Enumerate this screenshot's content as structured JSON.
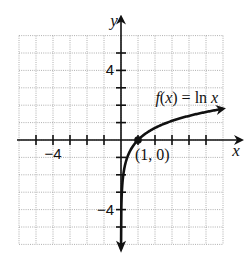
{
  "chart_data": {
    "type": "line",
    "title": "",
    "xlabel": "x",
    "ylabel": "y",
    "xlim": [
      -6,
      6
    ],
    "ylim": [
      -6,
      6
    ],
    "grid": true,
    "x_tick_step": 1,
    "y_tick_step": 1,
    "x_tick_labels": [
      {
        "value": -4,
        "label": "−4"
      }
    ],
    "y_tick_labels": [
      {
        "value": 4,
        "label": "4"
      },
      {
        "value": -4,
        "label": "−4"
      }
    ],
    "series": [
      {
        "name": "f(x) = ln x",
        "function": "ln",
        "x_range": [
          0.02,
          6
        ],
        "arrow_ends": true,
        "color": "#111111"
      }
    ],
    "annotations": [
      {
        "type": "point",
        "x": 1,
        "y": 0,
        "label": "(1, 0)"
      },
      {
        "type": "label",
        "text_parts": [
          "f",
          "(",
          "x",
          ") = ln ",
          "x"
        ],
        "text": "f(x) = ln x",
        "anchor_x": 4.2,
        "anchor_y": 2.4
      }
    ]
  }
}
